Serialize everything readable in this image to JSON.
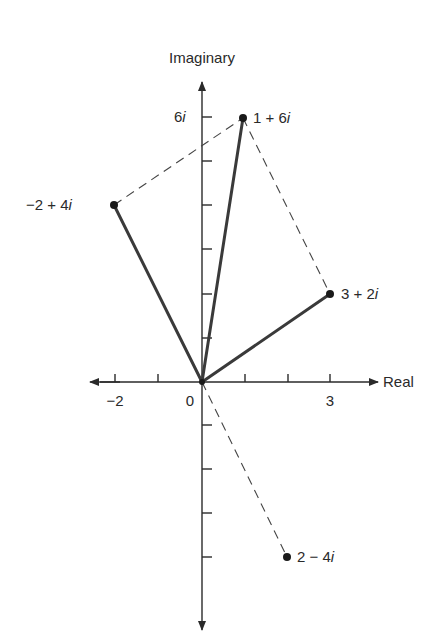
{
  "figure": {
    "axes": {
      "x_label": "Real",
      "y_label": "Imaginary",
      "x_ticks": [
        -2,
        -1,
        0,
        1,
        2,
        3
      ],
      "y_ticks": [
        -4,
        -3,
        -2,
        -1,
        0,
        1,
        2,
        3,
        4,
        5,
        6
      ],
      "x_tick_labels": {
        "-2": "−2",
        "0": "0",
        "3": "3"
      },
      "y_tick_labels": {
        "6": "6i"
      }
    },
    "origin_label": "0",
    "points": [
      {
        "label": "1 + 6i",
        "re": 1,
        "im": 6,
        "vector": "solid"
      },
      {
        "label": "−2 + 4i",
        "re": -2,
        "im": 4,
        "vector": "solid"
      },
      {
        "label": "3 + 2i",
        "re": 3,
        "im": 2,
        "vector": "solid"
      },
      {
        "label": "2 − 4i",
        "re": 2,
        "im": -4,
        "vector": "dashed"
      }
    ],
    "dashed_segments": [
      {
        "from": "−2 + 4i",
        "to": "1 + 6i"
      },
      {
        "from": "1 + 6i",
        "to": "3 + 2i"
      },
      {
        "from": "0",
        "to": "2 − 4i"
      }
    ],
    "colors": {
      "ink": "#2a2a2a",
      "vector": "#3a3a3a"
    }
  },
  "labels": {
    "x_axis": "Real",
    "y_axis": "Imaginary",
    "tick_neg2": "−2",
    "tick_0": "0",
    "tick_3": "3",
    "tick_6i": "6",
    "p1_a": "1 + 6",
    "p2_a": "−2 + 4",
    "p3_a": "3 + 2",
    "p4_a": "2 − 4",
    "i": "i"
  }
}
